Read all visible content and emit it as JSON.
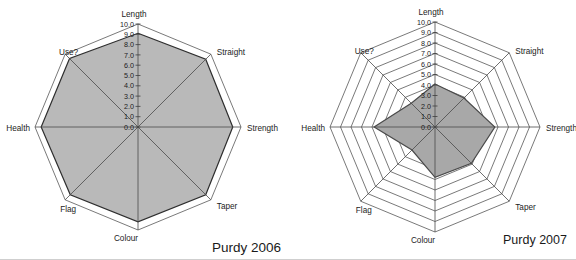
{
  "page": {
    "background_color": "#ffffff"
  },
  "chart_data": [
    {
      "type": "radar",
      "title": "Purdy 2006",
      "categories": [
        "Length",
        "Straight",
        "Strength",
        "Taper",
        "Colour",
        "Flag",
        "Health",
        "Use?"
      ],
      "values": [
        9.1,
        9.3,
        9.2,
        9.3,
        9.2,
        9.3,
        9.4,
        9.4
      ],
      "axis_range": [
        0,
        10
      ],
      "tick_interval": 1,
      "tick_labels": [
        "10.0",
        "9.0",
        "8.0",
        "7.0",
        "6.0",
        "5.0",
        "4.0",
        "3.0",
        "2.0",
        "1.0",
        "0.0"
      ],
      "grid": true,
      "legend": "none",
      "fill_color": "#b9b9b9",
      "outline_color": "#2e2e2e",
      "grid_color": "#3f3f3f",
      "spoke_color": "#4a4a4a",
      "text_color": "#1c1c1c"
    },
    {
      "type": "radar",
      "title": "Purdy 2007",
      "categories": [
        "Length",
        "Straight",
        "Strength",
        "Taper",
        "Colour",
        "Flag",
        "Health",
        "Use?"
      ],
      "values": [
        4.1,
        3.9,
        5.7,
        4.9,
        4.8,
        3.1,
        5.8,
        3.2
      ],
      "axis_range": [
        0,
        10
      ],
      "tick_interval": 1,
      "tick_labels": [
        "10.0",
        "9.0",
        "8.0",
        "7.0",
        "6.0",
        "5.0",
        "4.0",
        "3.0",
        "2.0",
        "1.0",
        "0.0"
      ],
      "grid": true,
      "legend": "none",
      "fill_color": "#a8a8a8",
      "outline_color": "#4a4a4a",
      "grid_color": "#3f3f3f",
      "spoke_color": "#4a4a4a",
      "text_color": "#1c1c1c"
    }
  ]
}
